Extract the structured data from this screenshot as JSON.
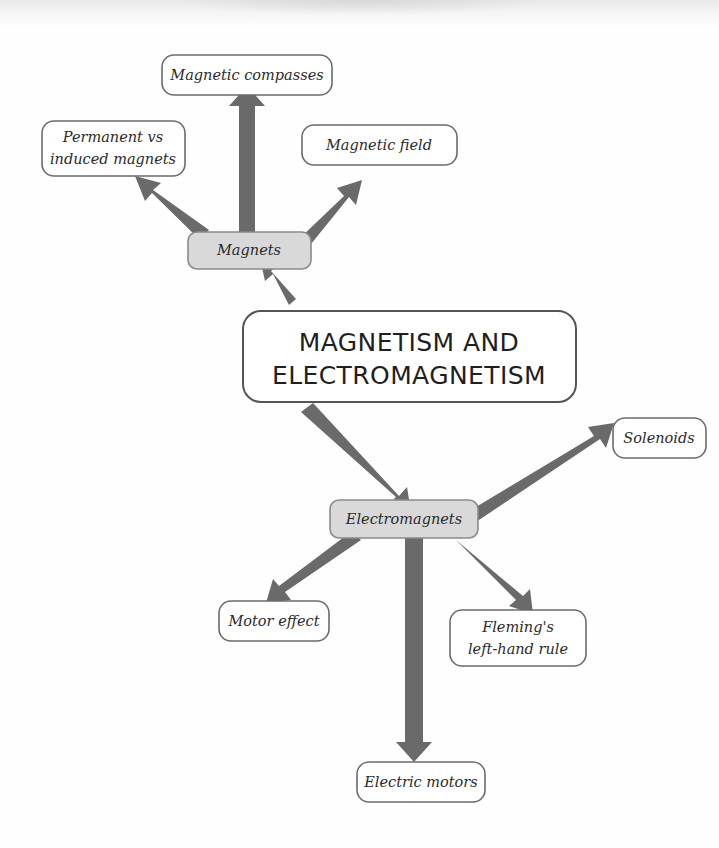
{
  "diagram": {
    "type": "mind-map",
    "title": "MAGNETISM AND ELECTROMAGNETISM",
    "background_color": "#fefefe",
    "arrow_color": "#6a6a6a",
    "branch_node_fill": "#d9d9d9",
    "leaf_node_fill": "#ffffff",
    "node_border_color": "#6b6b6b"
  },
  "center": {
    "id": "center",
    "line1": "MAGNETISM AND",
    "line2": "ELECTROMAGNETISM"
  },
  "branches": [
    {
      "id": "magnets",
      "label": "Magnets"
    },
    {
      "id": "electromagnets",
      "label": "Electromagnets"
    }
  ],
  "leaves": [
    {
      "id": "magnetic-compasses",
      "label": "Magnetic compasses",
      "parent": "magnets"
    },
    {
      "id": "permanent-vs-induced-magnets",
      "line1": "Permanent vs",
      "line2": "induced magnets",
      "parent": "magnets"
    },
    {
      "id": "magnetic-field",
      "label": "Magnetic field",
      "parent": "magnets"
    },
    {
      "id": "solenoids",
      "label": "Solenoids",
      "parent": "electromagnets"
    },
    {
      "id": "motor-effect",
      "label": "Motor effect",
      "parent": "electromagnets"
    },
    {
      "id": "flemings-left-hand-rule",
      "line1": "Fleming's",
      "line2": "left-hand rule",
      "parent": "electromagnets"
    },
    {
      "id": "electric-motors",
      "label": "Electric motors",
      "parent": "electromagnets"
    }
  ],
  "edges": [
    {
      "from": "center",
      "to": "magnets"
    },
    {
      "from": "magnets",
      "to": "magnetic-compasses"
    },
    {
      "from": "magnets",
      "to": "permanent-vs-induced-magnets"
    },
    {
      "from": "magnets",
      "to": "magnetic-field"
    },
    {
      "from": "center",
      "to": "electromagnets"
    },
    {
      "from": "electromagnets",
      "to": "solenoids"
    },
    {
      "from": "electromagnets",
      "to": "motor-effect"
    },
    {
      "from": "electromagnets",
      "to": "flemings-left-hand-rule"
    },
    {
      "from": "electromagnets",
      "to": "electric-motors"
    }
  ]
}
